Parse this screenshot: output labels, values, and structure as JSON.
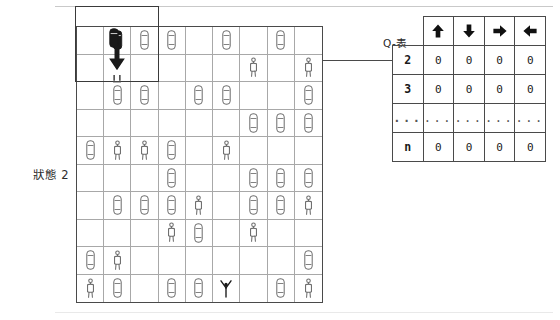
{
  "diagram": {
    "state_label": "狀態 2",
    "connector": "state-to-qtable-link"
  },
  "grid": {
    "columns": 9,
    "rows": 10,
    "highlight": {
      "col": 1,
      "row": 1,
      "width_cols": 3,
      "height_rows": 2,
      "label": "selected-state-region"
    },
    "agent": {
      "col": 2,
      "row": 1,
      "icon": "black-car-icon",
      "action_icon": "arrow-down-icon"
    },
    "cells": [
      {
        "row": 1,
        "col": 2,
        "icon": "agent-car-icon"
      },
      {
        "row": 1,
        "col": 3,
        "icon": "car-icon"
      },
      {
        "row": 1,
        "col": 4,
        "icon": "car-icon"
      },
      {
        "row": 1,
        "col": 6,
        "icon": "car-icon"
      },
      {
        "row": 1,
        "col": 8,
        "icon": "car-icon"
      },
      {
        "row": 2,
        "col": 7,
        "icon": "person-icon"
      },
      {
        "row": 2,
        "col": 9,
        "icon": "person-icon"
      },
      {
        "row": 3,
        "col": 2,
        "icon": "car-icon"
      },
      {
        "row": 3,
        "col": 3,
        "icon": "car-icon"
      },
      {
        "row": 3,
        "col": 5,
        "icon": "car-icon"
      },
      {
        "row": 3,
        "col": 6,
        "icon": "car-icon"
      },
      {
        "row": 3,
        "col": 9,
        "icon": "car-icon"
      },
      {
        "row": 4,
        "col": 7,
        "icon": "car-icon"
      },
      {
        "row": 4,
        "col": 8,
        "icon": "car-icon"
      },
      {
        "row": 4,
        "col": 9,
        "icon": "car-icon"
      },
      {
        "row": 5,
        "col": 1,
        "icon": "car-icon"
      },
      {
        "row": 5,
        "col": 2,
        "icon": "person-icon"
      },
      {
        "row": 5,
        "col": 3,
        "icon": "person-icon"
      },
      {
        "row": 5,
        "col": 4,
        "icon": "car-icon"
      },
      {
        "row": 5,
        "col": 6,
        "icon": "person-icon"
      },
      {
        "row": 6,
        "col": 4,
        "icon": "car-icon"
      },
      {
        "row": 6,
        "col": 7,
        "icon": "car-icon"
      },
      {
        "row": 6,
        "col": 8,
        "icon": "car-icon"
      },
      {
        "row": 6,
        "col": 9,
        "icon": "car-icon"
      },
      {
        "row": 7,
        "col": 2,
        "icon": "car-icon"
      },
      {
        "row": 7,
        "col": 3,
        "icon": "car-icon"
      },
      {
        "row": 7,
        "col": 4,
        "icon": "car-icon"
      },
      {
        "row": 7,
        "col": 5,
        "icon": "person-icon"
      },
      {
        "row": 7,
        "col": 7,
        "icon": "car-icon"
      },
      {
        "row": 7,
        "col": 8,
        "icon": "car-icon"
      },
      {
        "row": 7,
        "col": 9,
        "icon": "person-icon"
      },
      {
        "row": 8,
        "col": 4,
        "icon": "person-icon"
      },
      {
        "row": 8,
        "col": 5,
        "icon": "car-icon"
      },
      {
        "row": 8,
        "col": 7,
        "icon": "person-icon"
      },
      {
        "row": 9,
        "col": 1,
        "icon": "car-icon"
      },
      {
        "row": 9,
        "col": 2,
        "icon": "person-icon"
      },
      {
        "row": 9,
        "col": 9,
        "icon": "car-icon"
      },
      {
        "row": 10,
        "col": 1,
        "icon": "person-icon"
      },
      {
        "row": 10,
        "col": 2,
        "icon": "car-icon"
      },
      {
        "row": 10,
        "col": 4,
        "icon": "car-icon"
      },
      {
        "row": 10,
        "col": 5,
        "icon": "car-icon"
      },
      {
        "row": 10,
        "col": 6,
        "icon": "goal-person-icon"
      },
      {
        "row": 10,
        "col": 8,
        "icon": "car-icon"
      },
      {
        "row": 10,
        "col": 9,
        "icon": "person-icon"
      }
    ]
  },
  "qtable": {
    "title": "Q-表",
    "action_headers": [
      {
        "icon": "arrow-up-icon",
        "name": "up"
      },
      {
        "icon": "arrow-down-icon",
        "name": "down"
      },
      {
        "icon": "arrow-right-icon",
        "name": "right"
      },
      {
        "icon": "arrow-left-icon",
        "name": "left"
      }
    ],
    "rows": [
      {
        "state": "2",
        "values": [
          "0",
          "0",
          "0",
          "0"
        ]
      },
      {
        "state": "3",
        "values": [
          "0",
          "0",
          "0",
          "0"
        ]
      },
      {
        "state": "...",
        "values": [
          "...",
          "...",
          "...",
          "..."
        ]
      },
      {
        "state": "n",
        "values": [
          "0",
          "0",
          "0",
          "0"
        ]
      }
    ]
  },
  "colors": {
    "grid_line": "#a8a8a8",
    "grid_border": "#4a4a4a",
    "icon_outline": "#6b6b6b",
    "agent_fill": "#1a1a1a",
    "arrow_fill": "#1a1a1a"
  }
}
